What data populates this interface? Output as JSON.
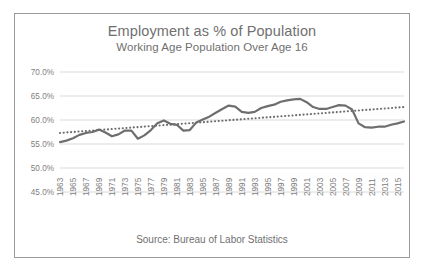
{
  "chart_data": {
    "type": "line",
    "title": "Employment as % of Population",
    "subtitle": "Working Age Population Over Age 16",
    "source": "Source: Bureau of Labor Statistics",
    "xlabel": "",
    "ylabel": "",
    "ylim": [
      45.0,
      70.0
    ],
    "ytick_values": [
      70.0,
      65.0,
      60.0,
      55.0,
      50.0,
      45.0
    ],
    "ytick_labels": [
      "70.0%",
      "65.0%",
      "60.0%",
      "55.0%",
      "50.0%",
      "45.0%"
    ],
    "xlim": [
      1963,
      2016
    ],
    "xtick_labels": [
      "1963",
      "1965",
      "1967",
      "1969",
      "1971",
      "1973",
      "1975",
      "1977",
      "1979",
      "1981",
      "1983",
      "1985",
      "1987",
      "1989",
      "1991",
      "1993",
      "1995",
      "1997",
      "1999",
      "2001",
      "2003",
      "2005",
      "2007",
      "2009",
      "2011",
      "2013",
      "2015"
    ],
    "grid": "horizontal",
    "legend": "none",
    "series": [
      {
        "name": "Employment as % of Population",
        "style": "solid",
        "color": "#6e6e6e",
        "x": [
          1963,
          1964,
          1965,
          1966,
          1967,
          1968,
          1969,
          1970,
          1971,
          1972,
          1973,
          1974,
          1975,
          1976,
          1977,
          1978,
          1979,
          1980,
          1981,
          1982,
          1983,
          1984,
          1985,
          1986,
          1987,
          1988,
          1989,
          1990,
          1991,
          1992,
          1993,
          1994,
          1995,
          1996,
          1997,
          1998,
          1999,
          2000,
          2001,
          2002,
          2003,
          2004,
          2005,
          2006,
          2007,
          2008,
          2009,
          2010,
          2011,
          2012,
          2013,
          2014,
          2015,
          2016
        ],
        "values": [
          55.4,
          55.7,
          56.2,
          56.9,
          57.3,
          57.5,
          58.0,
          57.4,
          56.6,
          57.0,
          57.8,
          57.8,
          56.1,
          56.8,
          57.9,
          59.3,
          59.9,
          59.2,
          59.0,
          57.8,
          57.9,
          59.5,
          60.1,
          60.7,
          61.5,
          62.3,
          63.0,
          62.8,
          61.7,
          61.5,
          61.7,
          62.5,
          62.9,
          63.2,
          63.8,
          64.1,
          64.3,
          64.4,
          63.7,
          62.7,
          62.3,
          62.3,
          62.7,
          63.1,
          63.0,
          62.2,
          59.3,
          58.5,
          58.4,
          58.6,
          58.6,
          59.0,
          59.3,
          59.7
        ]
      },
      {
        "name": "Linear trend",
        "style": "dotted",
        "color": "#6e6e6e",
        "x": [
          1963,
          2016
        ],
        "values": [
          57.3,
          62.7
        ]
      }
    ]
  }
}
